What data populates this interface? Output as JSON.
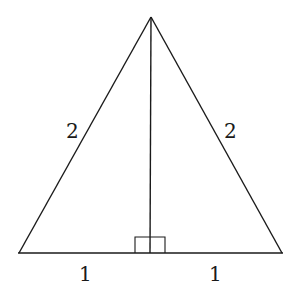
{
  "diagram": {
    "type": "isosceles-triangle-with-altitude",
    "stroke_color": "#1a1a1a",
    "vertices": {
      "apex": [
        151,
        17
      ],
      "base_left": [
        19,
        253
      ],
      "base_right": [
        282,
        253
      ],
      "altitude_foot": [
        150,
        253
      ]
    },
    "right_angle_marker": {
      "x1": 135,
      "x2": 165,
      "y_top": 236,
      "y_base": 253
    },
    "labels": {
      "left_side": "2",
      "right_side": "2",
      "base_left_segment": "1",
      "base_right_segment": "1"
    }
  }
}
